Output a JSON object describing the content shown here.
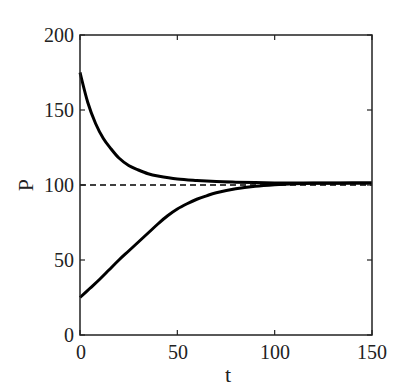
{
  "chart_data": {
    "type": "line",
    "title": "",
    "xlabel": "t",
    "ylabel": "P",
    "xlim": [
      0,
      150
    ],
    "ylim": [
      0,
      200
    ],
    "xticks": [
      0,
      50,
      100,
      150
    ],
    "yticks": [
      0,
      50,
      100,
      150,
      200
    ],
    "xtick_labels": [
      "0",
      "50",
      "100",
      "150"
    ],
    "ytick_labels": [
      "0",
      "50",
      "100",
      "150",
      "200"
    ],
    "grid": false,
    "legend": null,
    "series": [
      {
        "name": "P(0)=175 (decreasing)",
        "style": "solid",
        "color": "#000000",
        "x": [
          0,
          4,
          8,
          12,
          16,
          20,
          25,
          30,
          35,
          40,
          50,
          60,
          70,
          80,
          90,
          100,
          110,
          120,
          130,
          140,
          150
        ],
        "y": [
          175,
          155,
          141,
          131,
          124,
          118,
          113,
          110,
          107.5,
          106,
          104,
          103,
          102.3,
          101.9,
          101.6,
          101.4,
          101.3,
          101.3,
          101.3,
          101.3,
          101.3
        ]
      },
      {
        "name": "P(0)=25 (increasing)",
        "style": "solid",
        "color": "#000000",
        "x": [
          0,
          5,
          10,
          15,
          20,
          25,
          30,
          35,
          40,
          45,
          50,
          55,
          60,
          65,
          70,
          80,
          90,
          100,
          110,
          120,
          130,
          140,
          150
        ],
        "y": [
          25,
          31,
          37,
          43.5,
          50,
          56,
          62,
          68,
          74,
          79.5,
          84,
          87.5,
          90.5,
          92.8,
          94.8,
          97.5,
          99.2,
          100.2,
          100.8,
          101.1,
          101.2,
          101.3,
          101.3
        ]
      },
      {
        "name": "P=100 reference",
        "style": "dashed",
        "color": "#000000",
        "x": [
          0,
          150
        ],
        "y": [
          100,
          100
        ]
      }
    ]
  },
  "axes": {
    "xlabel": "t",
    "ylabel": "P",
    "xtick_labels": [
      "0",
      "50",
      "100",
      "150"
    ],
    "ytick_labels": [
      "0",
      "50",
      "100",
      "150",
      "200"
    ]
  }
}
